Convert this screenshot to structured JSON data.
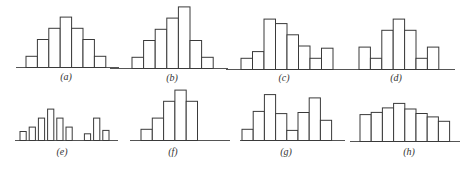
{
  "chart_data": [
    {
      "type": "bar",
      "label": "(a)",
      "description": "symmetric unimodal histogram",
      "categories": [
        1,
        2,
        3,
        4,
        5,
        6,
        7
      ],
      "values": [
        1,
        2.5,
        3.5,
        4.5,
        3.5,
        2.5,
        1
      ],
      "xlabel": "",
      "ylabel": "",
      "grid": false
    },
    {
      "type": "bar",
      "label": "(b)",
      "description": "left-skewed histogram",
      "categories": [
        1,
        2,
        3,
        4,
        5,
        6,
        7
      ],
      "values": [
        1,
        2.5,
        3.5,
        4.5,
        5.5,
        2.5,
        1
      ],
      "xlabel": "",
      "ylabel": "",
      "grid": false
    },
    {
      "type": "bar",
      "label": "(c)",
      "description": "right-skewed histogram with isolated rise at right",
      "categories": [
        1,
        2,
        3,
        4,
        5,
        6,
        7,
        8
      ],
      "values": [
        1,
        1.6,
        4.5,
        4.1,
        3.1,
        2.1,
        1,
        1.9
      ],
      "xlabel": "",
      "ylabel": "",
      "grid": false
    },
    {
      "type": "bar",
      "label": "(d)",
      "description": "comb-like histogram with secondary peaks at edges",
      "categories": [
        1,
        2,
        3,
        4,
        5,
        6,
        7
      ],
      "values": [
        2,
        1,
        3.5,
        4.5,
        3.5,
        1,
        2
      ],
      "xlabel": "",
      "ylabel": "",
      "grid": false
    },
    {
      "type": "bar",
      "label": "(e)",
      "description": "histogram with isolated island group",
      "categories": [
        1,
        2,
        3,
        4,
        5,
        6,
        7,
        8,
        9,
        10
      ],
      "values": [
        0.8,
        1.2,
        2,
        2.8,
        2,
        1.2,
        0,
        0.6,
        2,
        0.9
      ],
      "xlabel": "",
      "ylabel": "",
      "grid": false
    },
    {
      "type": "bar",
      "label": "(f)",
      "description": "truncated (cut-off) histogram",
      "categories": [
        1,
        2,
        3,
        4,
        5
      ],
      "values": [
        1,
        2,
        3.5,
        4.5,
        3.5
      ],
      "xlabel": "",
      "ylabel": "",
      "grid": false
    },
    {
      "type": "bar",
      "label": "(g)",
      "description": "bimodal histogram",
      "categories": [
        1,
        2,
        3,
        4,
        5,
        6,
        7,
        8
      ],
      "values": [
        1,
        2.6,
        4.1,
        2.4,
        0.9,
        2.5,
        3.8,
        1.8
      ],
      "xlabel": "",
      "ylabel": "",
      "grid": false
    },
    {
      "type": "bar",
      "label": "(h)",
      "description": "flat (plateau) histogram",
      "categories": [
        1,
        2,
        3,
        4,
        5,
        6,
        7,
        8
      ],
      "values": [
        2.4,
        2.6,
        3,
        3.4,
        2.9,
        2.5,
        2.2,
        1.8
      ],
      "xlabel": "",
      "ylabel": "",
      "grid": false
    }
  ]
}
